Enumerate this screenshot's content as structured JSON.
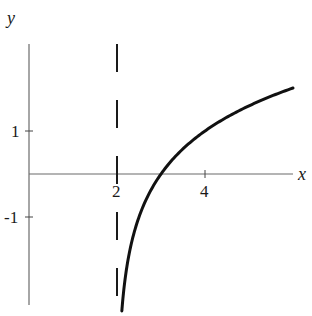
{
  "chart_data": {
    "type": "line",
    "title": "",
    "xlabel": "x",
    "ylabel": "y",
    "xlim": [
      0,
      6.0
    ],
    "ylim": [
      -3.0,
      3.0
    ],
    "grid": false,
    "x_ticks": [
      {
        "value": 2,
        "label": "2"
      },
      {
        "value": 4,
        "label": "4"
      }
    ],
    "y_ticks": [
      {
        "value": 1,
        "label": "1"
      },
      {
        "value": -1,
        "label": "-1"
      }
    ],
    "asymptote": {
      "type": "vertical",
      "x": 2,
      "style": "dashed"
    },
    "series": [
      {
        "name": "y = log2(x - 2)",
        "x": [
          2.11,
          2.15,
          2.2,
          2.3,
          2.4,
          2.5,
          2.7,
          3.0,
          3.5,
          4.0,
          4.5,
          5.0,
          5.5,
          6.0
        ],
        "y": [
          -3.0,
          -2.74,
          -2.32,
          -1.74,
          -1.32,
          -1.0,
          -0.51,
          0.0,
          0.58,
          1.0,
          1.32,
          1.58,
          1.81,
          2.0
        ]
      }
    ]
  },
  "labels": {
    "x_axis": "x",
    "y_axis": "y",
    "tick_x_2": "2",
    "tick_x_4": "4",
    "tick_y_1": "1",
    "tick_y_neg1": "-1"
  }
}
